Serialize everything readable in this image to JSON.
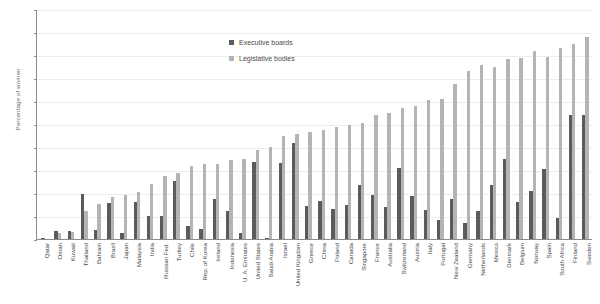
{
  "chart_data": {
    "type": "bar",
    "title": "",
    "xlabel": "",
    "ylabel": "Percentage of women",
    "ylim": [
      0,
      50
    ],
    "yticks": [
      0,
      5,
      10,
      15,
      20,
      25,
      30,
      35,
      40,
      45,
      50
    ],
    "grid": true,
    "legend_position": "top-center",
    "categories": [
      "Qatar",
      "Oman",
      "Kuwait",
      "Thailand",
      "Bahrain",
      "Brazil",
      "Japan",
      "Malaysia",
      "India",
      "Russian Fed.",
      "Turkey",
      "Chile",
      "Rep. of Korea",
      "Ireland",
      "Indonesia",
      "U. A. Emirates",
      "United States",
      "Saudi Arabia",
      "Israel",
      "United Kingdom",
      "Greece",
      "China",
      "Poland",
      "Canada",
      "Singapore",
      "France",
      "Australia",
      "Switzerland",
      "Austria",
      "Italy",
      "Portugal",
      "New Zealand",
      "Germany",
      "Netherlands",
      "Mexico",
      "Denmark",
      "Belgium",
      "Norway",
      "Spain",
      "South Africa",
      "Finland",
      "Sweden"
    ],
    "series": [
      {
        "name": "Executive boards",
        "color": "#5b5b5b",
        "values": [
          0.3,
          1.8,
          1.7,
          9.8,
          1.9,
          7.8,
          1.2,
          8.0,
          4.9,
          4.9,
          12.7,
          2.9,
          2.1,
          8.8,
          6.1,
          1.3,
          16.8,
          0.2,
          16.6,
          20.8,
          7.1,
          8.2,
          6.6,
          7.4,
          11.8,
          9.5,
          6.9,
          15.4,
          9.4,
          6.2,
          4.2,
          8.6,
          3.4,
          6.0,
          11.8,
          17.4,
          8.0,
          10.5,
          15.2,
          4.5,
          27.0,
          27.0
        ]
      },
      {
        "name": "Legislative bodies",
        "color": "#b4b4b4",
        "values": [
          0.0,
          1.2,
          1.5,
          6.1,
          7.6,
          9.2,
          9.5,
          10.3,
          12.0,
          13.7,
          14.3,
          15.8,
          16.2,
          16.2,
          17.1,
          17.5,
          19.4,
          20.0,
          22.5,
          22.9,
          23.2,
          23.6,
          24.3,
          24.7,
          25.3,
          26.9,
          27.3,
          28.5,
          29.0,
          30.2,
          30.5,
          33.6,
          36.5,
          37.8,
          37.4,
          39.1,
          39.3,
          40.8,
          39.6,
          41.5,
          42.5,
          44.0
        ]
      }
    ]
  },
  "legend": {
    "items": [
      {
        "label": "Executive boards",
        "color": "#5b5b5b"
      },
      {
        "label": "Legislative bodies",
        "color": "#b4b4b4"
      }
    ]
  }
}
